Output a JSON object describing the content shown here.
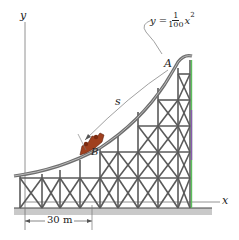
{
  "figure": {
    "axes": {
      "y_label": "y",
      "x_label": "x"
    },
    "equation": {
      "lhs": "y =",
      "numerator": "1",
      "denominator": "100",
      "rhs": "x",
      "exponent": "2"
    },
    "points": {
      "A": "A",
      "B": "B"
    },
    "path_label": "s",
    "dimension": {
      "label": "30 m"
    },
    "colors": {
      "structure": "#5a5a5a",
      "track": "#6e6e6e",
      "car": "#a0401e",
      "ground": "#bdbdbd",
      "accent_green": "#5cbf5c",
      "accent_purple": "#8a5ab0"
    }
  }
}
